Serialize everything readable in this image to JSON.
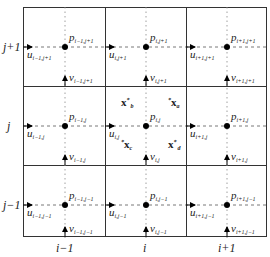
{
  "diagram": {
    "colors": {
      "line": "#333333",
      "dashed": "#555555",
      "dotted": "#888888",
      "node": "#000000",
      "text": "#222222"
    },
    "row_labels": [
      "j+1",
      "j",
      "j−1"
    ],
    "col_labels": [
      "i−1",
      "i",
      "i+1"
    ],
    "pressure_nodes": [
      {
        "sym": "p",
        "sub": "i−1,j+1"
      },
      {
        "sym": "p",
        "sub": "i,j+1"
      },
      {
        "sym": "p",
        "sub": "i+1,j+1"
      },
      {
        "sym": "p",
        "sub": "i−1,j"
      },
      {
        "sym": "p",
        "sub": "i,j"
      },
      {
        "sym": "p",
        "sub": "i+1,j"
      },
      {
        "sym": "p",
        "sub": "i−1,j−1"
      },
      {
        "sym": "p",
        "sub": "i,j−1"
      },
      {
        "sym": "p",
        "sub": "i+1,j−1"
      }
    ],
    "u_velocities": [
      {
        "sym": "u",
        "sub": "i−1,j+1"
      },
      {
        "sym": "u",
        "sub": "i,j+1"
      },
      {
        "sym": "u",
        "sub": "i+1,j+1"
      },
      {
        "sym": "u",
        "sub": "i−1,j"
      },
      {
        "sym": "u",
        "sub": "i,j"
      },
      {
        "sym": "u",
        "sub": "i+1,j"
      },
      {
        "sym": "u",
        "sub": "i−1,j−1"
      },
      {
        "sym": "u",
        "sub": "i,j−1"
      },
      {
        "sym": "u",
        "sub": "i+1,j−1"
      }
    ],
    "v_velocities": [
      {
        "sym": "v",
        "sub": "i−1,j+1"
      },
      {
        "sym": "v",
        "sub": "i,j+1"
      },
      {
        "sym": "v",
        "sub": "i+1,j+1"
      },
      {
        "sym": "v",
        "sub": "i−1,j"
      },
      {
        "sym": "v",
        "sub": "i,j"
      },
      {
        "sym": "v",
        "sub": "i+1,j"
      },
      {
        "sym": "v",
        "sub": "i−1,j−1"
      },
      {
        "sym": "v",
        "sub": "i,j−1"
      },
      {
        "sym": "v",
        "sub": "i+1,j−1"
      }
    ],
    "particles": [
      {
        "sym": "x",
        "sup": "*",
        "sub": "b"
      },
      {
        "sym": "x",
        "sup": "*",
        "sub": "a"
      },
      {
        "sym": "x",
        "sup": "*",
        "sub": "c"
      },
      {
        "sym": "x",
        "sup": "*",
        "sub": "d"
      }
    ]
  }
}
